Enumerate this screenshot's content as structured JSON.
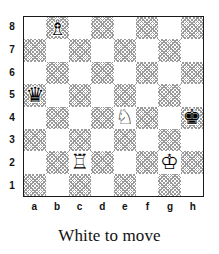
{
  "diagram": {
    "caption": "White to move",
    "side_to_move": "white",
    "board": {
      "file_labels": [
        "a",
        "b",
        "c",
        "d",
        "e",
        "f",
        "g",
        "h"
      ],
      "rank_labels": [
        "8",
        "7",
        "6",
        "5",
        "4",
        "3",
        "2",
        "1"
      ],
      "light_square_color": "#ffffff",
      "dark_square_color": "#9a9a9a",
      "border_color": "#1a1a1a",
      "orientation": "white-bottom",
      "squares": [
        {
          "square": "a8",
          "shade": "light",
          "piece": null
        },
        {
          "square": "b8",
          "shade": "dark",
          "piece": {
            "name": "white-bishop",
            "color": "white",
            "type": "bishop",
            "glyph": "♗"
          }
        },
        {
          "square": "c8",
          "shade": "light",
          "piece": null
        },
        {
          "square": "d8",
          "shade": "dark",
          "piece": null
        },
        {
          "square": "e8",
          "shade": "light",
          "piece": null
        },
        {
          "square": "f8",
          "shade": "dark",
          "piece": null
        },
        {
          "square": "g8",
          "shade": "light",
          "piece": null
        },
        {
          "square": "h8",
          "shade": "dark",
          "piece": null
        },
        {
          "square": "a7",
          "shade": "dark",
          "piece": null
        },
        {
          "square": "b7",
          "shade": "light",
          "piece": null
        },
        {
          "square": "c7",
          "shade": "dark",
          "piece": null
        },
        {
          "square": "d7",
          "shade": "light",
          "piece": null
        },
        {
          "square": "e7",
          "shade": "dark",
          "piece": null
        },
        {
          "square": "f7",
          "shade": "light",
          "piece": null
        },
        {
          "square": "g7",
          "shade": "dark",
          "piece": null
        },
        {
          "square": "h7",
          "shade": "light",
          "piece": null
        },
        {
          "square": "a6",
          "shade": "light",
          "piece": null
        },
        {
          "square": "b6",
          "shade": "dark",
          "piece": null
        },
        {
          "square": "c6",
          "shade": "light",
          "piece": null
        },
        {
          "square": "d6",
          "shade": "dark",
          "piece": null
        },
        {
          "square": "e6",
          "shade": "light",
          "piece": null
        },
        {
          "square": "f6",
          "shade": "dark",
          "piece": null
        },
        {
          "square": "g6",
          "shade": "light",
          "piece": null
        },
        {
          "square": "h6",
          "shade": "dark",
          "piece": null
        },
        {
          "square": "a5",
          "shade": "dark",
          "piece": {
            "name": "black-queen",
            "color": "black",
            "type": "queen",
            "glyph": "♛"
          }
        },
        {
          "square": "b5",
          "shade": "light",
          "piece": null
        },
        {
          "square": "c5",
          "shade": "dark",
          "piece": null
        },
        {
          "square": "d5",
          "shade": "light",
          "piece": null
        },
        {
          "square": "e5",
          "shade": "dark",
          "piece": null
        },
        {
          "square": "f5",
          "shade": "light",
          "piece": null
        },
        {
          "square": "g5",
          "shade": "dark",
          "piece": null
        },
        {
          "square": "h5",
          "shade": "light",
          "piece": null
        },
        {
          "square": "a4",
          "shade": "light",
          "piece": null
        },
        {
          "square": "b4",
          "shade": "dark",
          "piece": null
        },
        {
          "square": "c4",
          "shade": "light",
          "piece": null
        },
        {
          "square": "d4",
          "shade": "dark",
          "piece": null
        },
        {
          "square": "e4",
          "shade": "light",
          "piece": {
            "name": "white-knight",
            "color": "white",
            "type": "knight",
            "glyph": "♘"
          }
        },
        {
          "square": "f4",
          "shade": "dark",
          "piece": null
        },
        {
          "square": "g4",
          "shade": "light",
          "piece": null
        },
        {
          "square": "h4",
          "shade": "dark",
          "piece": {
            "name": "black-king",
            "color": "black",
            "type": "king",
            "glyph": "♚"
          }
        },
        {
          "square": "a3",
          "shade": "dark",
          "piece": null
        },
        {
          "square": "b3",
          "shade": "light",
          "piece": null
        },
        {
          "square": "c3",
          "shade": "dark",
          "piece": null
        },
        {
          "square": "d3",
          "shade": "light",
          "piece": null
        },
        {
          "square": "e3",
          "shade": "dark",
          "piece": null
        },
        {
          "square": "f3",
          "shade": "light",
          "piece": null
        },
        {
          "square": "g3",
          "shade": "dark",
          "piece": null
        },
        {
          "square": "h3",
          "shade": "light",
          "piece": null
        },
        {
          "square": "a2",
          "shade": "light",
          "piece": null
        },
        {
          "square": "b2",
          "shade": "dark",
          "piece": null
        },
        {
          "square": "c2",
          "shade": "light",
          "piece": {
            "name": "white-rook",
            "color": "white",
            "type": "rook",
            "glyph": "♖"
          }
        },
        {
          "square": "d2",
          "shade": "dark",
          "piece": null
        },
        {
          "square": "e2",
          "shade": "light",
          "piece": null
        },
        {
          "square": "f2",
          "shade": "dark",
          "piece": null
        },
        {
          "square": "g2",
          "shade": "light",
          "piece": {
            "name": "white-king",
            "color": "white",
            "type": "king",
            "glyph": "♔"
          }
        },
        {
          "square": "h2",
          "shade": "dark",
          "piece": null
        },
        {
          "square": "a1",
          "shade": "dark",
          "piece": null
        },
        {
          "square": "b1",
          "shade": "light",
          "piece": null
        },
        {
          "square": "c1",
          "shade": "dark",
          "piece": null
        },
        {
          "square": "d1",
          "shade": "light",
          "piece": null
        },
        {
          "square": "e1",
          "shade": "dark",
          "piece": null
        },
        {
          "square": "f1",
          "shade": "light",
          "piece": null
        },
        {
          "square": "g1",
          "shade": "dark",
          "piece": null
        },
        {
          "square": "h1",
          "shade": "light",
          "piece": null
        }
      ]
    }
  }
}
